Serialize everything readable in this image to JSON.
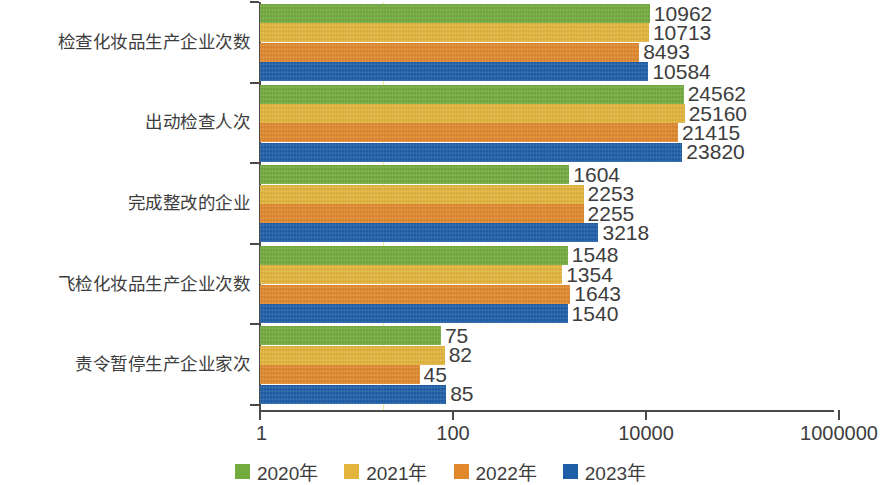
{
  "chart_data": {
    "type": "bar",
    "orientation": "horizontal",
    "title": "",
    "subtitle": "",
    "xlabel": "",
    "ylabel": "",
    "xscale": "log",
    "xlim": [
      1,
      1000000
    ],
    "xticks": [
      1,
      100,
      10000,
      1000000
    ],
    "xtick_labels": [
      "1",
      "100",
      "10000",
      "1000000"
    ],
    "grid": true,
    "legend_position": "bottom",
    "categories": [
      "检查化妆品生产企业次数",
      "出动检查人次",
      "完成整改的企业",
      "飞检化妆品生产企业次数",
      "责令暂停生产企业家次"
    ],
    "series": [
      {
        "name": "2020年",
        "color": "#73ab3e",
        "values": [
          10962,
          24562,
          1604,
          1548,
          75
        ]
      },
      {
        "name": "2021年",
        "color": "#e3b53d",
        "values": [
          10713,
          25160,
          2253,
          1354,
          82
        ]
      },
      {
        "name": "2022年",
        "color": "#e1882d",
        "values": [
          8493,
          21415,
          2255,
          1643,
          45
        ]
      },
      {
        "name": "2023年",
        "color": "#1e5ea8",
        "values": [
          10584,
          23820,
          3218,
          1540,
          85
        ]
      }
    ],
    "data_labels": [
      [
        "10962",
        "10713",
        "8493",
        "10584"
      ],
      [
        "24562",
        "25160",
        "21415",
        "23820"
      ],
      [
        "1604",
        "2253",
        "2255",
        "3218"
      ],
      [
        "1548",
        "1354",
        "1643",
        "1540"
      ],
      [
        "75",
        "82",
        "45",
        "85"
      ]
    ]
  },
  "legend": {
    "items": [
      {
        "label": "2020年"
      },
      {
        "label": "2021年"
      },
      {
        "label": "2022年"
      },
      {
        "label": "2023年"
      }
    ]
  }
}
